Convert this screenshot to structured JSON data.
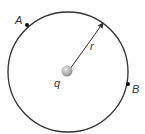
{
  "diagram": {
    "charge": {
      "label": "q",
      "color": "#b5b5b5"
    },
    "radius": {
      "label": "r"
    },
    "points": [
      {
        "label": "A"
      },
      {
        "label": "B"
      }
    ],
    "colors": {
      "stroke": "#333333",
      "background": "#ffffff"
    }
  }
}
